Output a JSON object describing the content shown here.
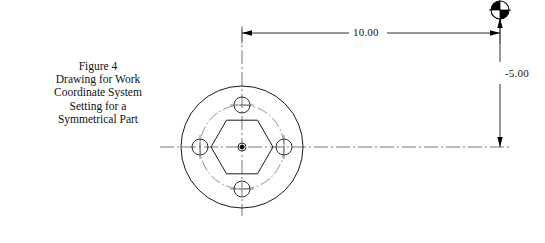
{
  "figure": {
    "caption_lines": [
      "Figure 4",
      "Drawing for Work",
      "Coordinate System",
      "Setting for a",
      "Symmetrical Part"
    ],
    "caption_full": "Figure 4 Drawing for Work Coordinate System Setting for a Symmetrical Part"
  },
  "dimensions": {
    "horizontal": {
      "label": "10.00",
      "axis": "X"
    },
    "vertical": {
      "label": "-5.00",
      "axis": "Y"
    }
  },
  "part": {
    "outer_circle": {
      "cx": 242,
      "cy": 147,
      "r": 61
    },
    "bolt_circle": {
      "cx": 242,
      "cy": 147,
      "r": 42,
      "style": "dash-dot"
    },
    "hexagon": {
      "cx": 242,
      "cy": 147,
      "circumradius": 31,
      "orientation": "flat-top"
    },
    "center_point": {
      "cx": 242,
      "cy": 147
    },
    "holes": [
      {
        "cx": 242,
        "cy": 105,
        "r": 8,
        "position": "top"
      },
      {
        "cx": 284,
        "cy": 147,
        "r": 8,
        "position": "right"
      },
      {
        "cx": 242,
        "cy": 189,
        "r": 8,
        "position": "bottom"
      },
      {
        "cx": 200,
        "cy": 147,
        "r": 8,
        "position": "left"
      }
    ]
  },
  "work_origin": {
    "cx": 500,
    "cy": 10,
    "r": 9,
    "symbol": "work-coordinate-origin"
  },
  "colors": {
    "line": "#1a1a1a",
    "thin_line": "#3a3a3a",
    "center_line": "#555555",
    "background": "#ffffff"
  }
}
